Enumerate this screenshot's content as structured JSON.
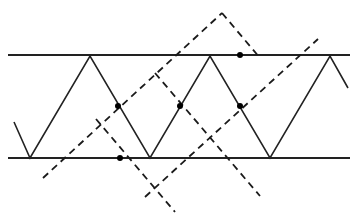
{
  "figure": {
    "type": "geometric-line-diagram",
    "canvas": {
      "width": 357,
      "height": 213,
      "background": "#ffffff"
    },
    "colors": {
      "stroke": "#1a1a1a",
      "solid_stroke": "#222222",
      "dashed_stroke": "#1a1a1a",
      "dot_fill": "#000000",
      "background": "#ffffff"
    },
    "stroke_widths": {
      "boundary": 2.0,
      "zigzag": 1.6,
      "dashed": 1.8
    },
    "dash_pattern": "7 5",
    "boundaries": [
      {
        "name": "top-boundary-line",
        "y": 55,
        "x1": 8,
        "x2": 350
      },
      {
        "name": "bottom-boundary-line",
        "y": 158,
        "x1": 8,
        "x2": 350
      }
    ],
    "zigzag": {
      "name": "solid-zigzag-path",
      "points": [
        {
          "x": 14,
          "y": 122
        },
        {
          "x": 30,
          "y": 158
        },
        {
          "x": 90,
          "y": 56
        },
        {
          "x": 150,
          "y": 158
        },
        {
          "x": 210,
          "y": 56
        },
        {
          "x": 270,
          "y": 158
        },
        {
          "x": 330,
          "y": 56
        },
        {
          "x": 348,
          "y": 88
        }
      ]
    },
    "dashed_lines": [
      {
        "name": "dashed-line-up-right-lower",
        "x1": 43,
        "y1": 178,
        "x2": 222,
        "y2": 13
      },
      {
        "name": "dashed-line-up-right-upper",
        "x1": 145,
        "y1": 197,
        "x2": 318,
        "y2": 39
      },
      {
        "name": "dashed-line-down-right-left",
        "x1": 96,
        "y1": 119,
        "x2": 175,
        "y2": 212
      },
      {
        "name": "dashed-line-down-right-right",
        "x1": 155,
        "y1": 73,
        "x2": 260,
        "y2": 196
      },
      {
        "name": "dashed-line-down-right-far",
        "x1": 222,
        "y1": 13,
        "x2": 260,
        "y2": 58
      }
    ],
    "dots": [
      {
        "name": "intersection-dot-1",
        "x": 118,
        "y": 106,
        "r": 3.0
      },
      {
        "name": "intersection-dot-2",
        "x": 120,
        "y": 158,
        "r": 3.0
      },
      {
        "name": "intersection-dot-3",
        "x": 180,
        "y": 106,
        "r": 3.0
      },
      {
        "name": "intersection-dot-4",
        "x": 240,
        "y": 106,
        "r": 3.0
      },
      {
        "name": "intersection-dot-5",
        "x": 240,
        "y": 55,
        "r": 3.0
      }
    ]
  }
}
